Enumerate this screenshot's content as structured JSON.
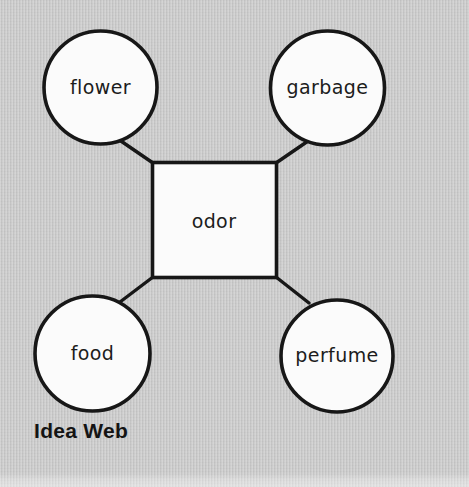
{
  "figure": {
    "caption": "Idea Web",
    "center": {
      "label": "odor",
      "shape": "rectangle"
    },
    "nodes": [
      {
        "id": "flower",
        "label": "flower",
        "shape": "circle",
        "position": "top-left"
      },
      {
        "id": "garbage",
        "label": "garbage",
        "shape": "circle",
        "position": "top-right"
      },
      {
        "id": "food",
        "label": "food",
        "shape": "circle",
        "position": "bottom-left"
      },
      {
        "id": "perfume",
        "label": "perfume",
        "shape": "circle",
        "position": "bottom-right"
      }
    ],
    "connections": [
      {
        "from": "odor",
        "to": "flower"
      },
      {
        "from": "odor",
        "to": "garbage"
      },
      {
        "from": "odor",
        "to": "food"
      },
      {
        "from": "odor",
        "to": "perfume"
      }
    ],
    "colors": {
      "background": "#c6c6c6",
      "node_fill": "#fbfbfb",
      "outline": "#171717",
      "text": "#1c1c1c",
      "caption": "#141414"
    }
  }
}
